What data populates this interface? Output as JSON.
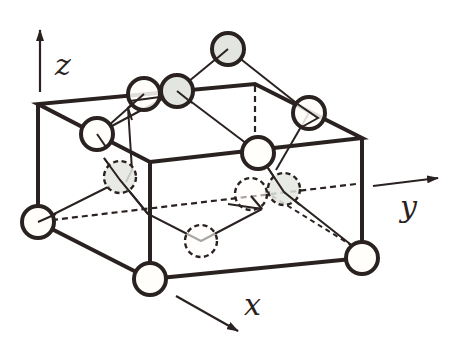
{
  "diagram": {
    "type": "crystal-unit-cell",
    "colors": {
      "stroke": "#2a2220",
      "open_atom_fill": "#fffefa",
      "shaded_atom_fill": "#e3e6e0",
      "background": "#ffffff"
    },
    "axes": {
      "z": {
        "label": "z"
      },
      "y": {
        "label": "y"
      },
      "x": {
        "label": "x"
      }
    },
    "box": {
      "top_face": [
        [
          38,
          104
        ],
        [
          255,
          84
        ],
        [
          362,
          138
        ],
        [
          150,
          162
        ]
      ],
      "front_verticals": [
        [
          [
            38,
            104
          ],
          [
            38,
            222
          ]
        ],
        [
          [
            150,
            162
          ],
          [
            150,
            279
          ]
        ],
        [
          [
            362,
            138
          ],
          [
            362,
            258
          ]
        ]
      ],
      "bottom_front_edges": [
        [
          [
            38,
            222
          ],
          [
            150,
            279
          ]
        ],
        [
          [
            150,
            279
          ],
          [
            362,
            258
          ]
        ]
      ],
      "hidden_edges": [
        [
          [
            255,
            84
          ],
          [
            255,
            160
          ]
        ],
        [
          [
            38,
            222
          ],
          [
            356,
            184
          ]
        ]
      ]
    },
    "atoms": [
      {
        "id": "a1",
        "x": 38,
        "y": 222,
        "style": "open",
        "hidden": false
      },
      {
        "id": "a2",
        "x": 150,
        "y": 279,
        "style": "open",
        "hidden": false
      },
      {
        "id": "a3",
        "x": 362,
        "y": 258,
        "style": "open",
        "hidden": false
      },
      {
        "id": "a4",
        "x": 97,
        "y": 134,
        "style": "open",
        "hidden": false
      },
      {
        "id": "a5",
        "x": 144,
        "y": 94,
        "style": "open",
        "hidden": false
      },
      {
        "id": "a6",
        "x": 177,
        "y": 91,
        "style": "shaded",
        "hidden": false
      },
      {
        "id": "a7",
        "x": 228,
        "y": 49,
        "style": "shaded",
        "hidden": false
      },
      {
        "id": "a8",
        "x": 309,
        "y": 113,
        "style": "open",
        "hidden": false
      },
      {
        "id": "a9",
        "x": 258,
        "y": 153,
        "style": "open",
        "hidden": false
      },
      {
        "id": "a10",
        "x": 120,
        "y": 177,
        "style": "shaded",
        "hidden": true
      },
      {
        "id": "a11",
        "x": 201,
        "y": 241,
        "style": "open",
        "hidden": true
      },
      {
        "id": "a12",
        "x": 251,
        "y": 194,
        "style": "open",
        "hidden": true
      },
      {
        "id": "a13",
        "x": 284,
        "y": 189,
        "style": "shaded",
        "hidden": true
      }
    ],
    "bonds": [
      {
        "from": [
          38,
          222
        ],
        "to": [
          120,
          186
        ],
        "dashed": false
      },
      {
        "from": [
          38,
          222
        ],
        "to": [
          356,
          184
        ],
        "dashed": true
      },
      {
        "from": [
          120,
          177
        ],
        "to": [
          201,
          241
        ],
        "dashed": false,
        "via": [
          [
            104,
            158
          ],
          [
            120,
            177
          ]
        ]
      },
      {
        "from": [
          201,
          241
        ],
        "to": [
          262,
          209
        ],
        "dashed": false
      },
      {
        "from": [
          262,
          209
        ],
        "to": [
          251,
          194
        ],
        "dashed": false
      },
      {
        "from": [
          284,
          189
        ],
        "to": [
          359,
          251
        ],
        "dashed": false
      },
      {
        "from": [
          265,
          185
        ],
        "to": [
          359,
          251
        ],
        "dashed": true
      },
      {
        "from": [
          258,
          153
        ],
        "to": [
          284,
          189
        ],
        "dashed": false
      },
      {
        "from": [
          309,
          113
        ],
        "to": [
          278,
          170
        ],
        "dashed": false
      },
      {
        "from": [
          228,
          49
        ],
        "to": [
          309,
          113
        ],
        "dashed": false
      },
      {
        "from": [
          228,
          49
        ],
        "to": [
          183,
          70
        ],
        "dashed": false
      },
      {
        "from": [
          177,
          91
        ],
        "to": [
          309,
          113
        ],
        "dashed": false
      },
      {
        "from": [
          144,
          94
        ],
        "to": [
          97,
          134
        ],
        "dashed": false
      },
      {
        "from": [
          177,
          91
        ],
        "to": [
          97,
          134
        ],
        "dashed": false
      },
      {
        "from": [
          144,
          94
        ],
        "to": [
          120,
          177
        ],
        "dashed": false
      }
    ]
  }
}
